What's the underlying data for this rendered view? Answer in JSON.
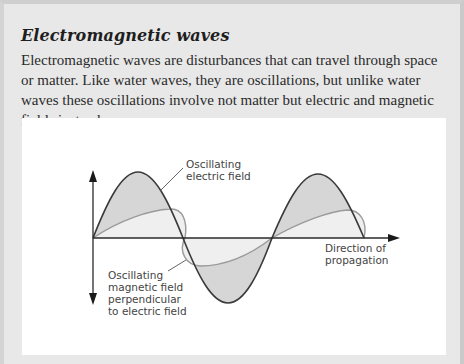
{
  "box": {
    "title": "Electromagnetic waves",
    "body": "Electromagnetic waves are disturbances that can travel through space or matter. Like water waves, they are oscillations, but unlike water waves these oscillations involve not matter but electric and magnetic fields instead."
  },
  "diagram": {
    "labels": {
      "electric_line1": "Oscillating",
      "electric_line2": "electric field",
      "magnetic_line1": "Oscillating",
      "magnetic_line2": "magnetic field",
      "magnetic_line3": "perpendicular",
      "magnetic_line4": "to electric field",
      "direction_line1": "Direction of",
      "direction_line2": "propagation"
    },
    "colors": {
      "electric_stroke": "#3a3a3a",
      "electric_fill": "#d4d4d4",
      "magnetic_stroke": "#9a9a9a",
      "magnetic_fill": "#ececec",
      "axis": "#2a2a2a"
    }
  }
}
